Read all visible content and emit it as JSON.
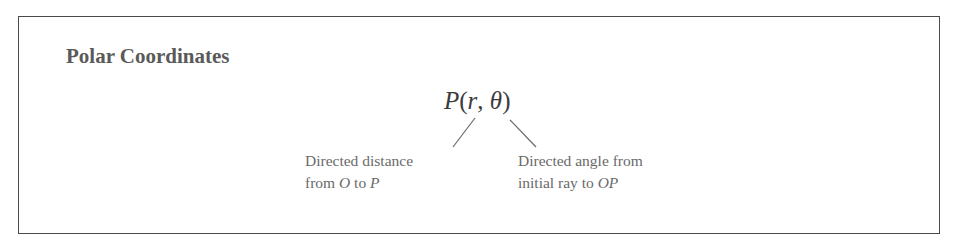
{
  "box": {
    "title": "Polar Coordinates"
  },
  "formula": {
    "point": "P",
    "open_paren": "(",
    "r": "r",
    "comma": ", ",
    "theta": "θ",
    "close_paren": ")"
  },
  "annotations": {
    "r": {
      "line1": "Directed distance",
      "line2_prefix": "from ",
      "line2_from": "O",
      "line2_mid": " to ",
      "line2_to": "P"
    },
    "theta": {
      "line1": "Directed angle from",
      "line2_prefix": "initial ray to ",
      "line2_to": "OP"
    }
  },
  "colors": {
    "border": "#4a4a4a",
    "title": "#5a5a5a",
    "formula": "#3c3c3c",
    "labels": "#6a6a6a"
  }
}
